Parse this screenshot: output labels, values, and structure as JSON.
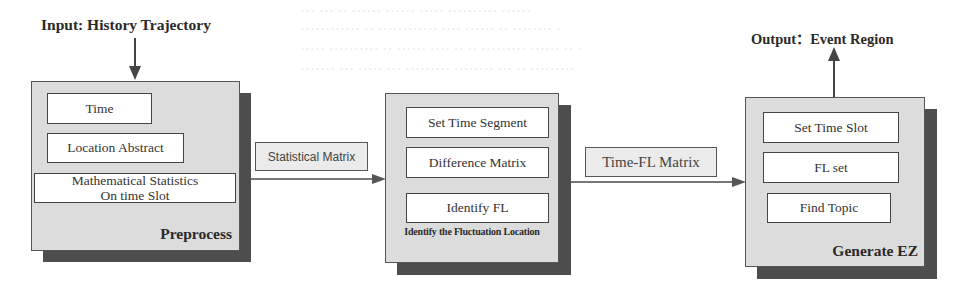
{
  "input": {
    "label": "Input: History Trajectory"
  },
  "output": {
    "label": "Output：Event Region"
  },
  "stages": [
    {
      "id": "preprocess",
      "title": "Preprocess",
      "steps": [
        {
          "label": "Time"
        },
        {
          "label": "Location Abstract"
        },
        {
          "label_line1": "Mathematical Statistics",
          "label_line2": "On time Slot"
        }
      ]
    },
    {
      "id": "identify",
      "title": "Identify the Fluctuation Location",
      "steps": [
        {
          "label": "Set Time Segment"
        },
        {
          "label": "Difference Matrix"
        },
        {
          "label": "Identify FL"
        }
      ]
    },
    {
      "id": "generate",
      "title": "Generate EZ",
      "steps": [
        {
          "label": "Set Time Slot"
        },
        {
          "label": "FL set"
        },
        {
          "label": "Find Topic"
        }
      ]
    }
  ],
  "connectors": [
    {
      "from": "preprocess",
      "to": "identify",
      "label": "Statistical Matrix"
    },
    {
      "from": "identify",
      "to": "generate",
      "label": "Time-FL Matrix"
    }
  ],
  "colors": {
    "panel_fill": "#dcdcdc",
    "panel_shadow": "#4d4d4d",
    "box_fill": "#ffffff",
    "border": "#444444"
  }
}
